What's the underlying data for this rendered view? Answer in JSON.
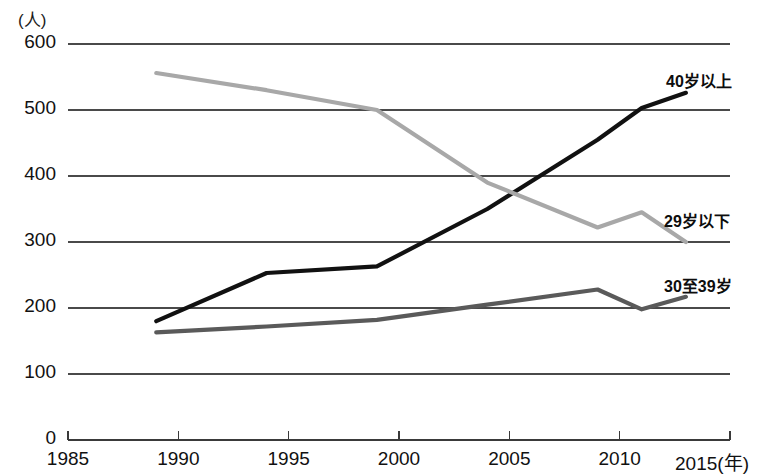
{
  "chart_data": {
    "type": "line",
    "title": "",
    "xlabel": "(年)",
    "ylabel": "(人)",
    "xlim": [
      1985,
      2015
    ],
    "ylim": [
      0,
      600
    ],
    "grid": true,
    "legend_position": "right-inline",
    "x_ticks": [
      "1985",
      "1990",
      "1995",
      "2000",
      "2005",
      "2010",
      "2015"
    ],
    "x_tick_values": [
      1985,
      1990,
      1995,
      2000,
      2005,
      2010,
      2015
    ],
    "y_ticks": [
      "0",
      "100",
      "200",
      "300",
      "400",
      "500",
      "600"
    ],
    "y_tick_values": [
      0,
      100,
      200,
      300,
      400,
      500,
      600
    ],
    "x_axis_suffix": "(年)",
    "y_axis_unit": "(人)",
    "series": [
      {
        "name": "40岁以上",
        "color": "#111111",
        "width": 4.2,
        "x": [
          1989,
          1994,
          1999,
          2004,
          2009,
          2011,
          2013
        ],
        "values": [
          180,
          253,
          263,
          350,
          455,
          503,
          526
        ]
      },
      {
        "name": "29岁以下",
        "color": "#a8a8a8",
        "width": 4.2,
        "x": [
          1989,
          1994,
          1999,
          2004,
          2009,
          2011,
          2013
        ],
        "values": [
          556,
          530,
          500,
          390,
          322,
          345,
          300
        ]
      },
      {
        "name": "30至39岁",
        "color": "#5a5a5a",
        "width": 4.2,
        "x": [
          1989,
          1994,
          1999,
          2004,
          2009,
          2011,
          2013
        ],
        "values": [
          163,
          172,
          182,
          205,
          228,
          198,
          217
        ]
      }
    ],
    "series_labels": [
      {
        "text": "40岁以上",
        "x": 666,
        "y": 68
      },
      {
        "text": "29岁以下",
        "x": 664,
        "y": 208
      },
      {
        "text": "30至39岁",
        "x": 664,
        "y": 273
      }
    ]
  }
}
